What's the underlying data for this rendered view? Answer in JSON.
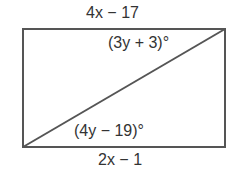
{
  "diagram": {
    "shape": "rectangle with diagonal",
    "top_side_label": "4x − 17",
    "bottom_side_label": "2x − 1",
    "top_right_angle_label": "(3y + 3)°",
    "bottom_left_angle_label": "(4y − 19)°",
    "stroke_color": "#555555"
  }
}
